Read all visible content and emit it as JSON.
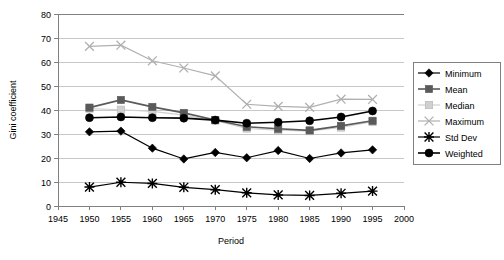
{
  "chart_data": {
    "type": "line",
    "title": "",
    "xlabel": "Period",
    "ylabel": "Gini coefficient",
    "xlim": [
      1945,
      2000
    ],
    "ylim": [
      0,
      80
    ],
    "xticks": [
      1945,
      1950,
      1955,
      1960,
      1965,
      1970,
      1975,
      1980,
      1985,
      1990,
      1995,
      2000
    ],
    "yticks": [
      0,
      10,
      20,
      30,
      40,
      50,
      60,
      70,
      80
    ],
    "grid": "horizontal",
    "legend_position": "right",
    "x": [
      1950,
      1955,
      1960,
      1965,
      1970,
      1975,
      1980,
      1985,
      1990,
      1995
    ],
    "series": [
      {
        "name": "Minimum",
        "marker": "diamond",
        "color": "#000000",
        "values": [
          30.9,
          31.2,
          24.1,
          19.6,
          22.3,
          20.1,
          23.1,
          19.8,
          22.1,
          23.4
        ]
      },
      {
        "name": "Mean",
        "marker": "square",
        "color": "#5a5a5a",
        "values": [
          41.0,
          44.2,
          41.3,
          38.8,
          35.8,
          33.0,
          32.2,
          31.5,
          33.4,
          35.5
        ]
      },
      {
        "name": "Median",
        "marker": "square-light",
        "color": "#d0d0d0",
        "values": [
          40.6,
          40.1,
          39.4,
          37.9,
          35.6,
          32.3,
          31.6,
          31.2,
          32.7,
          35.1
        ]
      },
      {
        "name": "Maximum",
        "marker": "cross",
        "color": "#b0b0b0",
        "values": [
          66.5,
          67.0,
          60.5,
          57.5,
          54.2,
          42.4,
          41.5,
          41.1,
          44.5,
          44.4
        ]
      },
      {
        "name": "Std Dev",
        "marker": "star",
        "color": "#000000",
        "values": [
          7.9,
          9.9,
          9.4,
          7.8,
          6.8,
          5.5,
          4.6,
          4.4,
          5.3,
          6.2
        ]
      },
      {
        "name": "Weighted",
        "marker": "circle",
        "color": "#000000",
        "values": [
          36.8,
          37.1,
          36.8,
          36.6,
          35.8,
          34.5,
          34.9,
          35.5,
          37.1,
          39.6
        ]
      }
    ]
  },
  "legend": {
    "items": [
      {
        "label": "Minimum"
      },
      {
        "label": "Mean"
      },
      {
        "label": "Median"
      },
      {
        "label": "Maximum"
      },
      {
        "label": "Std Dev"
      },
      {
        "label": "Weighted"
      }
    ]
  },
  "axes": {
    "y_title": "Gini coefficient",
    "x_title": "Period",
    "y_tick_labels": [
      "80",
      "70",
      "60",
      "50",
      "40",
      "30",
      "20",
      "10",
      "0"
    ],
    "x_tick_labels": [
      "1945",
      "1950",
      "1955",
      "1960",
      "1965",
      "1970",
      "1975",
      "1980",
      "1985",
      "1990",
      "1995",
      "2000"
    ]
  }
}
